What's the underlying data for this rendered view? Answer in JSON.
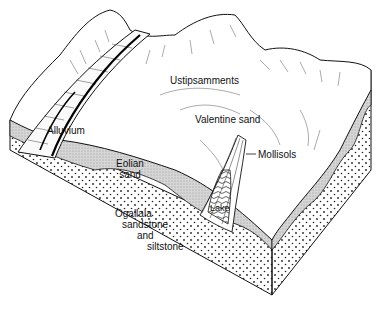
{
  "diagram": {
    "labels": {
      "ustipsamments": "Ustipsamments",
      "valentine_sand": "Valentine sand",
      "alluvium": "Alluvium",
      "mollisols": "Mollisols",
      "eolian_sand_line1": "Eolian",
      "eolian_sand_line2": "sand",
      "lake": "Lake",
      "ogallala_line1": "Ogallala",
      "ogallala_line2": "sandstone",
      "ogallala_line3": "and",
      "ogallala_line4": "siltstone"
    },
    "colors": {
      "line": "#111111",
      "eolian_fill": "#cfcfcf",
      "bedrock_fill": "#ffffff",
      "dots": "#222222",
      "background": "#ffffff"
    }
  }
}
